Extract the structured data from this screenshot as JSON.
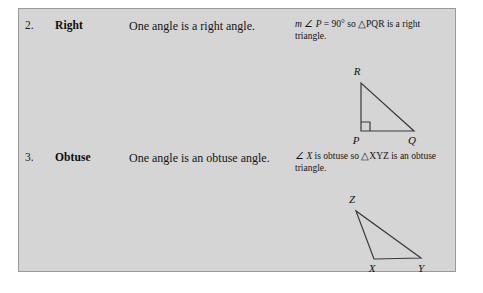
{
  "panel": {
    "background_color": "#d5d5d5",
    "border_color": "#9a9a9a"
  },
  "rows": [
    {
      "number": "2.",
      "name": "Right",
      "description": "One angle is a right angle.",
      "example_line1_pre": "m",
      "example_line1_angle": "∠ P",
      "example_line1_mid": "= 90° so",
      "example_line1_tri": "△PQR",
      "example_line1_post": "is a",
      "example_line2": "right triangle.",
      "figure": {
        "name": "right-triangle",
        "vertices": [
          {
            "label": "R",
            "x": 66,
            "y": 34
          },
          {
            "label": "P",
            "x": 66,
            "y": 82
          },
          {
            "label": "Q",
            "x": 119,
            "y": 82
          }
        ],
        "label_positions": [
          {
            "label": "R",
            "x": 62,
            "y": 26
          },
          {
            "label": "P",
            "x": 61,
            "y": 95
          },
          {
            "label": "Q",
            "x": 115,
            "y": 95
          }
        ],
        "right_angle_marker": {
          "x": 66,
          "y": 82,
          "size": 9
        },
        "stroke_color": "#3a3a3a"
      }
    },
    {
      "number": "3.",
      "name": "Obtuse",
      "description": "One angle is an obtuse angle.",
      "example_line1_pre": "",
      "example_line1_angle": "∠ X",
      "example_line1_mid": "is obtuse so",
      "example_line1_tri": "△XYZ",
      "example_line1_post": "",
      "example_line2": "is an obtuse triangle.",
      "figure": {
        "name": "obtuse-triangle",
        "vertices": [
          {
            "label": "Z",
            "x": 61,
            "y": 30
          },
          {
            "label": "X",
            "x": 79,
            "y": 78
          },
          {
            "label": "Y",
            "x": 126,
            "y": 77
          }
        ],
        "label_positions": [
          {
            "label": "Z",
            "x": 57,
            "y": 22
          },
          {
            "label": "X",
            "x": 75,
            "y": 90
          },
          {
            "label": "Y",
            "x": 124,
            "y": 90
          }
        ],
        "stroke_color": "#3a3a3a"
      }
    }
  ]
}
